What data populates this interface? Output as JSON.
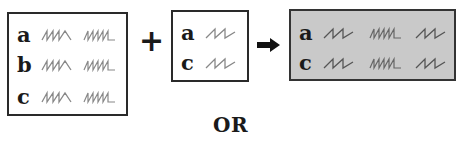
{
  "diagram": {
    "box1": {
      "rows": [
        {
          "label": "a",
          "squiggles": [
            "zigzag-3",
            "zigzag-5"
          ]
        },
        {
          "label": "b",
          "squiggles": [
            "zigzag-3",
            "zigzag-5"
          ]
        },
        {
          "label": "c",
          "squiggles": [
            "zigzag-3",
            "zigzag-5"
          ]
        }
      ]
    },
    "operator_plus": "+",
    "box2": {
      "rows": [
        {
          "label": "a",
          "squiggles": [
            "zigzag-2"
          ]
        },
        {
          "label": "c",
          "squiggles": [
            "zigzag-2"
          ]
        }
      ]
    },
    "operator_arrow": "right-arrow",
    "box3": {
      "fill": "#c9c9c9",
      "rows": [
        {
          "label": "a",
          "squiggles": [
            "zigzag-2",
            "zigzag-5",
            "zigzag-2"
          ]
        },
        {
          "label": "c",
          "squiggles": [
            "zigzag-2",
            "zigzag-5",
            "zigzag-2"
          ]
        }
      ]
    },
    "or_label": "OR"
  }
}
